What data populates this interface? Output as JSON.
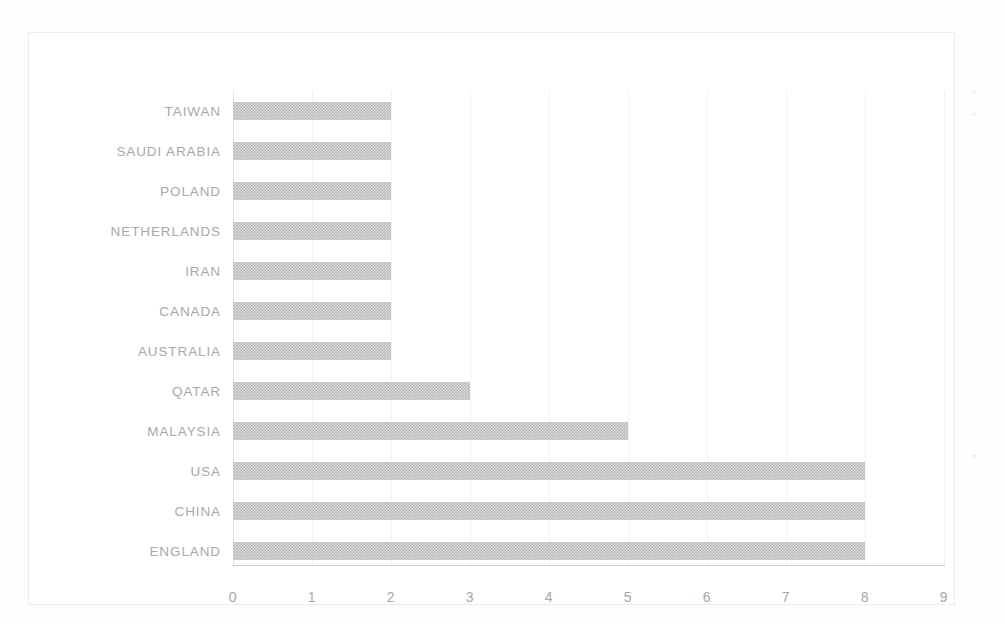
{
  "chart_data": {
    "type": "bar",
    "orientation": "horizontal",
    "title": "",
    "subtitle": "",
    "xlabel": "",
    "ylabel": "",
    "categories": [
      "TAIWAN",
      "SAUDI ARABIA",
      "POLAND",
      "NETHERLANDS",
      "IRAN",
      "CANADA",
      "AUSTRALIA",
      "QATAR",
      "MALAYSIA",
      "USA",
      "CHINA",
      "ENGLAND"
    ],
    "values": [
      2,
      2,
      2,
      2,
      2,
      2,
      2,
      3,
      5,
      8,
      8,
      8
    ],
    "xlim": [
      0,
      9
    ],
    "x_ticks": [
      0,
      1,
      2,
      3,
      4,
      5,
      6,
      7,
      8,
      9
    ],
    "x_tick_labels": [
      "0",
      "1",
      "2",
      "3",
      "4",
      "5",
      "6",
      "7",
      "8",
      "9"
    ],
    "grid": "vertical",
    "legend": "none",
    "bar_color": "#b9b9b9",
    "text_color": "#a8a8a8",
    "gridline_color": "#f2f2f2",
    "axis_line_color": "#cfcfcf",
    "frame_color": "#ededed",
    "background_color": "#ffffff"
  },
  "annotations": {
    "speck_top": "*",
    "speck_mid": "*"
  }
}
